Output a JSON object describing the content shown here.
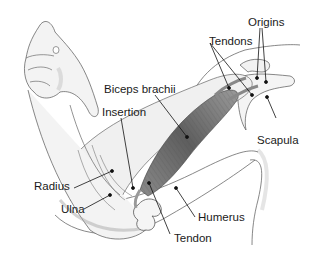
{
  "diagram": {
    "labels": {
      "tendons": "Tendons",
      "origins": "Origins",
      "biceps": "Biceps brachii",
      "insertion": "Insertion",
      "scapula": "Scapula",
      "radius": "Radius",
      "ulna": "Ulna",
      "humerus": "Humerus",
      "tendon": "Tendon"
    }
  }
}
